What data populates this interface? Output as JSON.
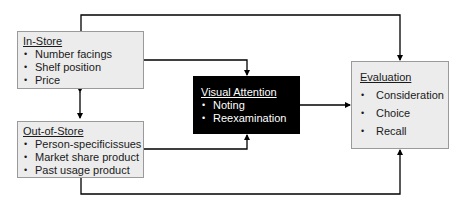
{
  "diagram": {
    "in_store": {
      "title": "In-Store",
      "items": [
        "Number facings",
        "Shelf position",
        "Price"
      ]
    },
    "out_of_store": {
      "title": "Out-of-Store",
      "items": [
        "Person-specificissues",
        "Market share product",
        "Past usage product"
      ]
    },
    "visual_attention": {
      "title": "Visual Attention",
      "items": [
        "Noting",
        "Reexamination"
      ]
    },
    "evaluation": {
      "title": "Evaluation",
      "items": [
        "Consideration",
        "Choice",
        "Recall"
      ]
    },
    "colors": {
      "box_fill": "#ececec",
      "box_border": "#9a9a9a",
      "dark_box_fill": "#000000",
      "line": "#000000"
    }
  }
}
